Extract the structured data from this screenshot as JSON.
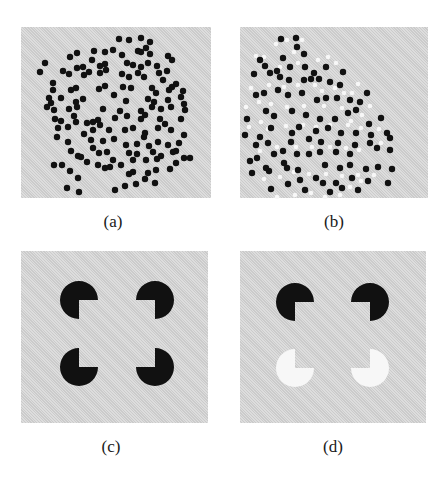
{
  "figure": {
    "background": "#ffffff",
    "panel_fill": "#d6d6d6",
    "dot_black": "#111111",
    "dot_white": "#f7f7f7",
    "panels": [
      {
        "id": "a",
        "label": "(a)",
        "x": 21,
        "y": 27,
        "w": 190,
        "h": 171,
        "label_x": 83,
        "label_y": 212,
        "type": "dots"
      },
      {
        "id": "b",
        "label": "(b)",
        "x": 240,
        "y": 27,
        "w": 188,
        "h": 171,
        "label_x": 304,
        "label_y": 212,
        "type": "dots"
      },
      {
        "id": "c",
        "label": "(c)",
        "x": 21,
        "y": 251,
        "w": 187,
        "h": 172,
        "label_x": 81,
        "label_y": 437,
        "type": "kanizsa"
      },
      {
        "id": "d",
        "label": "(d)",
        "x": 240,
        "y": 251,
        "w": 186,
        "h": 172,
        "label_x": 303,
        "label_y": 437,
        "type": "kanizsa"
      }
    ],
    "dots_a": [
      [
        98,
        12
      ],
      [
        108,
        13
      ],
      [
        120,
        11
      ],
      [
        129,
        15
      ],
      [
        56,
        26
      ],
      [
        73,
        24
      ],
      [
        84,
        25
      ],
      [
        92,
        23
      ],
      [
        101,
        28
      ],
      [
        117,
        24
      ],
      [
        125,
        21
      ],
      [
        129,
        27
      ],
      [
        147,
        29
      ],
      [
        120,
        25
      ],
      [
        24,
        36
      ],
      [
        19,
        45
      ],
      [
        49,
        30
      ],
      [
        56,
        41
      ],
      [
        62,
        40
      ],
      [
        71,
        33
      ],
      [
        79,
        39
      ],
      [
        84,
        37
      ],
      [
        106,
        36
      ],
      [
        112,
        38
      ],
      [
        120,
        40
      ],
      [
        127,
        36
      ],
      [
        136,
        39
      ],
      [
        146,
        44
      ],
      [
        151,
        33
      ],
      [
        42,
        44
      ],
      [
        48,
        47
      ],
      [
        63,
        48
      ],
      [
        68,
        45
      ],
      [
        79,
        46
      ],
      [
        85,
        43
      ],
      [
        101,
        47
      ],
      [
        108,
        50
      ],
      [
        117,
        46
      ],
      [
        123,
        50
      ],
      [
        138,
        46
      ],
      [
        142,
        53
      ],
      [
        155,
        57
      ],
      [
        151,
        60
      ],
      [
        32,
        56
      ],
      [
        32,
        63
      ],
      [
        50,
        63
      ],
      [
        55,
        61
      ],
      [
        78,
        62
      ],
      [
        84,
        59
      ],
      [
        102,
        60
      ],
      [
        110,
        61
      ],
      [
        131,
        61
      ],
      [
        135,
        66
      ],
      [
        148,
        63
      ],
      [
        162,
        64
      ],
      [
        160,
        70
      ],
      [
        28,
        71
      ],
      [
        30,
        76
      ],
      [
        40,
        71
      ],
      [
        55,
        75
      ],
      [
        62,
        72
      ],
      [
        93,
        68
      ],
      [
        105,
        74
      ],
      [
        127,
        72
      ],
      [
        133,
        75
      ],
      [
        147,
        73
      ],
      [
        163,
        77
      ],
      [
        26,
        80
      ],
      [
        33,
        83
      ],
      [
        48,
        82
      ],
      [
        56,
        80
      ],
      [
        82,
        82
      ],
      [
        99,
        84
      ],
      [
        120,
        84
      ],
      [
        131,
        80
      ],
      [
        140,
        82
      ],
      [
        150,
        80
      ],
      [
        164,
        83
      ],
      [
        34,
        92
      ],
      [
        40,
        94
      ],
      [
        53,
        89
      ],
      [
        55,
        95
      ],
      [
        72,
        95
      ],
      [
        77,
        93
      ],
      [
        94,
        91
      ],
      [
        106,
        89
      ],
      [
        120,
        92
      ],
      [
        124,
        88
      ],
      [
        139,
        92
      ],
      [
        144,
        97
      ],
      [
        160,
        92
      ],
      [
        37,
        101
      ],
      [
        47,
        100
      ],
      [
        66,
        96
      ],
      [
        72,
        103
      ],
      [
        79,
        98
      ],
      [
        88,
        103
      ],
      [
        104,
        103
      ],
      [
        112,
        101
      ],
      [
        124,
        106
      ],
      [
        137,
        101
      ],
      [
        150,
        103
      ],
      [
        163,
        108
      ],
      [
        36,
        110
      ],
      [
        47,
        115
      ],
      [
        63,
        107
      ],
      [
        70,
        113
      ],
      [
        82,
        114
      ],
      [
        93,
        112
      ],
      [
        105,
        118
      ],
      [
        116,
        117
      ],
      [
        123,
        110
      ],
      [
        137,
        115
      ],
      [
        147,
        118
      ],
      [
        158,
        116
      ],
      [
        50,
        124
      ],
      [
        57,
        129
      ],
      [
        72,
        121
      ],
      [
        78,
        126
      ],
      [
        86,
        125
      ],
      [
        92,
        133
      ],
      [
        108,
        126
      ],
      [
        116,
        127
      ],
      [
        128,
        119
      ],
      [
        132,
        125
      ],
      [
        140,
        129
      ],
      [
        155,
        124
      ],
      [
        33,
        138
      ],
      [
        41,
        138
      ],
      [
        60,
        130
      ],
      [
        66,
        135
      ],
      [
        77,
        138
      ],
      [
        89,
        140
      ],
      [
        100,
        138
      ],
      [
        112,
        133
      ],
      [
        125,
        133
      ],
      [
        136,
        132
      ],
      [
        155,
        136
      ],
      [
        163,
        131
      ],
      [
        49,
        144
      ],
      [
        57,
        151
      ],
      [
        84,
        141
      ],
      [
        108,
        147
      ],
      [
        112,
        145
      ],
      [
        127,
        146
      ],
      [
        135,
        143
      ],
      [
        149,
        142
      ],
      [
        169,
        131
      ],
      [
        152,
        125
      ],
      [
        46,
        161
      ],
      [
        58,
        165
      ],
      [
        94,
        163
      ],
      [
        104,
        159
      ],
      [
        115,
        157
      ],
      [
        124,
        152
      ],
      [
        134,
        156
      ]
    ],
    "dots_b": [
      [
        41,
        12
      ],
      [
        56,
        11
      ],
      [
        57,
        20
      ],
      [
        64,
        27
      ],
      [
        43,
        31
      ],
      [
        20,
        33
      ],
      [
        25,
        39
      ],
      [
        37,
        44
      ],
      [
        50,
        40
      ],
      [
        65,
        40
      ],
      [
        74,
        46
      ],
      [
        86,
        40
      ],
      [
        14,
        47
      ],
      [
        30,
        46
      ],
      [
        40,
        50
      ],
      [
        49,
        53
      ],
      [
        64,
        53
      ],
      [
        71,
        52
      ],
      [
        79,
        52
      ],
      [
        90,
        55
      ],
      [
        100,
        58
      ],
      [
        103,
        45
      ],
      [
        16,
        68
      ],
      [
        24,
        66
      ],
      [
        38,
        63
      ],
      [
        48,
        68
      ],
      [
        62,
        66
      ],
      [
        77,
        73
      ],
      [
        86,
        71
      ],
      [
        97,
        71
      ],
      [
        110,
        73
      ],
      [
        120,
        75
      ],
      [
        127,
        66
      ],
      [
        7,
        92
      ],
      [
        26,
        84
      ],
      [
        34,
        89
      ],
      [
        52,
        84
      ],
      [
        66,
        88
      ],
      [
        80,
        92
      ],
      [
        95,
        92
      ],
      [
        108,
        86
      ],
      [
        116,
        83
      ],
      [
        129,
        97
      ],
      [
        141,
        91
      ],
      [
        5,
        108
      ],
      [
        20,
        110
      ],
      [
        31,
        101
      ],
      [
        52,
        106
      ],
      [
        59,
        100
      ],
      [
        76,
        104
      ],
      [
        88,
        101
      ],
      [
        101,
        106
      ],
      [
        116,
        106
      ],
      [
        131,
        108
      ],
      [
        147,
        106
      ],
      [
        16,
        118
      ],
      [
        28,
        116
      ],
      [
        51,
        115
      ],
      [
        69,
        112
      ],
      [
        81,
        115
      ],
      [
        98,
        116
      ],
      [
        115,
        118
      ],
      [
        130,
        116
      ],
      [
        150,
        111
      ],
      [
        17,
        131
      ],
      [
        34,
        127
      ],
      [
        43,
        124
      ],
      [
        57,
        127
      ],
      [
        69,
        127
      ],
      [
        80,
        125
      ],
      [
        96,
        125
      ],
      [
        110,
        127
      ],
      [
        137,
        121
      ],
      [
        150,
        123
      ],
      [
        10,
        134
      ],
      [
        29,
        144
      ],
      [
        44,
        136
      ],
      [
        47,
        141
      ],
      [
        58,
        143
      ],
      [
        85,
        138
      ],
      [
        100,
        141
      ],
      [
        110,
        138
      ],
      [
        126,
        142
      ],
      [
        138,
        140
      ],
      [
        152,
        142
      ],
      [
        12,
        146
      ],
      [
        26,
        141
      ],
      [
        60,
        153
      ],
      [
        76,
        151
      ],
      [
        96,
        156
      ],
      [
        112,
        151
      ],
      [
        128,
        154
      ],
      [
        148,
        156
      ],
      [
        31,
        162
      ],
      [
        48,
        157
      ],
      [
        65,
        163
      ],
      [
        83,
        156
      ],
      [
        90,
        165
      ],
      [
        102,
        161
      ],
      [
        118,
        163
      ]
    ],
    "dots_b_white": [
      [
        47,
        13
      ],
      [
        62,
        13
      ],
      [
        36,
        17
      ],
      [
        16,
        29
      ],
      [
        24,
        30
      ],
      [
        40,
        40
      ],
      [
        54,
        25
      ],
      [
        58,
        36
      ],
      [
        78,
        33
      ],
      [
        88,
        30
      ],
      [
        96,
        36
      ],
      [
        11,
        61
      ],
      [
        19,
        75
      ],
      [
        29,
        58
      ],
      [
        44,
        60
      ],
      [
        58,
        58
      ],
      [
        75,
        58
      ],
      [
        82,
        64
      ],
      [
        95,
        61
      ],
      [
        104,
        66
      ],
      [
        112,
        66
      ],
      [
        118,
        57
      ],
      [
        6,
        80
      ],
      [
        21,
        95
      ],
      [
        31,
        77
      ],
      [
        47,
        80
      ],
      [
        64,
        79
      ],
      [
        84,
        79
      ],
      [
        102,
        81
      ],
      [
        111,
        94
      ],
      [
        122,
        88
      ],
      [
        130,
        79
      ],
      [
        9,
        100
      ],
      [
        28,
        102
      ],
      [
        46,
        99
      ],
      [
        63,
        98
      ],
      [
        76,
        100
      ],
      [
        90,
        98
      ],
      [
        108,
        98
      ],
      [
        121,
        101
      ],
      [
        139,
        102
      ],
      [
        20,
        124
      ],
      [
        37,
        120
      ],
      [
        56,
        120
      ],
      [
        72,
        120
      ],
      [
        90,
        120
      ],
      [
        106,
        121
      ],
      [
        119,
        123
      ],
      [
        141,
        116
      ],
      [
        24,
        152
      ],
      [
        40,
        150
      ],
      [
        54,
        145
      ],
      [
        69,
        147
      ],
      [
        86,
        147
      ],
      [
        102,
        149
      ],
      [
        118,
        148
      ],
      [
        134,
        148
      ],
      [
        37,
        170
      ],
      [
        55,
        168
      ],
      [
        71,
        166
      ],
      [
        85,
        170
      ],
      [
        100,
        168
      ],
      [
        110,
        160
      ],
      [
        121,
        154
      ]
    ],
    "kanizsa_c": [
      {
        "cx": 58,
        "cy": 49,
        "r": 19,
        "fill": "#111111",
        "mouth": "br"
      },
      {
        "cx": 134,
        "cy": 49,
        "r": 19,
        "fill": "#111111",
        "mouth": "bl"
      },
      {
        "cx": 58,
        "cy": 116,
        "r": 19,
        "fill": "#111111",
        "mouth": "tr"
      },
      {
        "cx": 134,
        "cy": 116,
        "r": 19,
        "fill": "#111111",
        "mouth": "tl"
      }
    ],
    "kanizsa_d": [
      {
        "cx": 55,
        "cy": 51,
        "r": 19,
        "fill": "#111111",
        "mouth": "br"
      },
      {
        "cx": 130,
        "cy": 51,
        "r": 19,
        "fill": "#111111",
        "mouth": "bl"
      },
      {
        "cx": 55,
        "cy": 117,
        "r": 19,
        "fill": "#f7f7f7",
        "mouth": "tr"
      },
      {
        "cx": 130,
        "cy": 117,
        "r": 19,
        "fill": "#f7f7f7",
        "mouth": "tl"
      }
    ]
  }
}
